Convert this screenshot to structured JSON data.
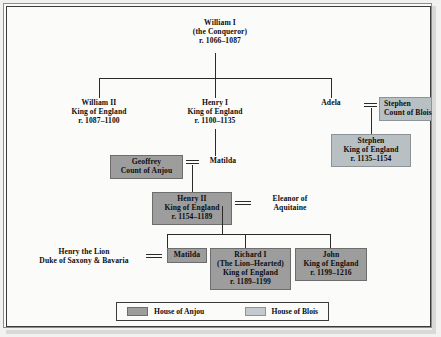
{
  "diagram": {
    "colors": {
      "anjou": "#9d9d9d",
      "blois": "#b9c0c4",
      "line": "#2b2b2b",
      "frame": "#3a3a3a"
    },
    "nodes": {
      "william_i": {
        "lines": [
          "William I",
          "(the Conqueror)",
          "r. 1066–1087"
        ],
        "style": "plain"
      },
      "william_ii": {
        "lines": [
          "William II",
          "King of England",
          "r. 1087–1100"
        ],
        "style": "plain"
      },
      "henry_i": {
        "lines": [
          "Henry I",
          "King of England",
          "r. 1100–1135"
        ],
        "style": "plain"
      },
      "adela": {
        "lines": [
          "Adela"
        ],
        "style": "plain"
      },
      "stephen_blois": {
        "lines": [
          "Stephen",
          "Count of Blois"
        ],
        "style": "blois"
      },
      "stephen_king": {
        "lines": [
          "Stephen",
          "King of England",
          "r. 1135–1154"
        ],
        "style": "blois"
      },
      "geoffrey": {
        "lines": [
          "Geoffrey",
          "Count of Anjou"
        ],
        "style": "anjou"
      },
      "matilda_1": {
        "lines": [
          "Matilda"
        ],
        "style": "plain"
      },
      "henry_ii": {
        "lines": [
          "Henry II",
          "King of England",
          "r. 1154–1189"
        ],
        "style": "anjou"
      },
      "eleanor": {
        "lines": [
          "Eleanor of",
          "Aquitaine"
        ],
        "style": "plain"
      },
      "henry_lion": {
        "lines": [
          "Henry the Lion",
          "Duke of Saxony & Bavaria"
        ],
        "style": "plain"
      },
      "matilda_2": {
        "lines": [
          "Matilda"
        ],
        "style": "anjou"
      },
      "richard_i": {
        "lines": [
          "Richard I",
          "(The Lion–Hearted)",
          "King of England",
          "r. 1189–1199"
        ],
        "style": "anjou"
      },
      "john": {
        "lines": [
          "John",
          "King of England",
          "r. 1199–1216"
        ],
        "style": "anjou"
      }
    },
    "legend": {
      "items": [
        {
          "swatch": "anjou",
          "label": "House of Anjou"
        },
        {
          "swatch": "blois",
          "label": "House of Blois"
        }
      ]
    }
  }
}
